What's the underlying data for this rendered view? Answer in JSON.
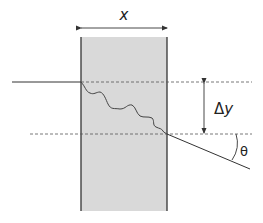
{
  "diagram": {
    "labels": {
      "width": "x",
      "displacement_delta": "Δ",
      "displacement_var": "y",
      "angle": "θ"
    },
    "colors": {
      "slab_fill": "#d9d9d9",
      "line": "#333333",
      "dashed": "#555555"
    }
  }
}
